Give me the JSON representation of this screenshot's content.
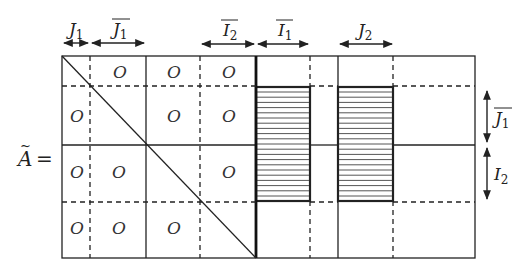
{
  "matrix_label": "Ã =",
  "matrix_symbol": "A",
  "equals": "=",
  "zero_symbol": "O",
  "top_labels": [
    {
      "id": "J1",
      "base": "J",
      "sub": "1",
      "overline": false
    },
    {
      "id": "J1bar",
      "base": "J",
      "sub": "1",
      "overline": true
    },
    {
      "id": "I2bar",
      "base": "I",
      "sub": "2",
      "overline": true
    },
    {
      "id": "I1bar",
      "base": "I",
      "sub": "1",
      "overline": true
    },
    {
      "id": "J2",
      "base": "J",
      "sub": "2",
      "overline": false
    }
  ],
  "right_labels": [
    {
      "id": "J1bar",
      "base": "J",
      "sub": "1",
      "overline": true
    },
    {
      "id": "I2",
      "base": "I",
      "sub": "2",
      "overline": false
    }
  ],
  "zero_blocks": [
    {
      "row": 1,
      "col": 2
    },
    {
      "row": 1,
      "col": 3
    },
    {
      "row": 1,
      "col": 4
    },
    {
      "row": 2,
      "col": 1
    },
    {
      "row": 2,
      "col": 3
    },
    {
      "row": 2,
      "col": 4
    },
    {
      "row": 3,
      "col": 1
    },
    {
      "row": 3,
      "col": 2
    },
    {
      "row": 3,
      "col": 4
    },
    {
      "row": 4,
      "col": 1
    },
    {
      "row": 4,
      "col": 2
    },
    {
      "row": 4,
      "col": 3
    }
  ],
  "hatched_blocks": [
    {
      "id": "block-I1bar",
      "columns": "I1bar",
      "rows": "J1bar ∪ I2"
    },
    {
      "id": "block-J2",
      "columns": "J2",
      "rows": "J1bar ∪ I2"
    }
  ],
  "colors": {
    "line": "#222222",
    "background": "#ffffff"
  }
}
